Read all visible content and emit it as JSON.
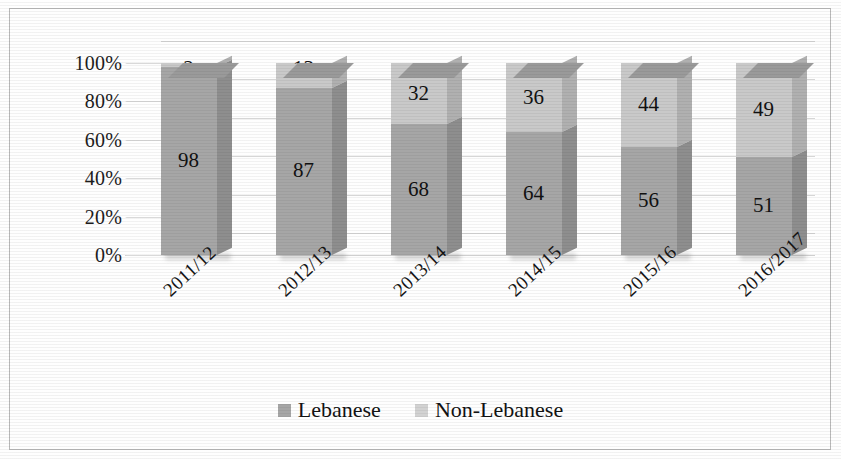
{
  "chart_data": {
    "type": "bar",
    "subtype": "stacked-100-percent-3d",
    "title": "",
    "xlabel": "",
    "ylabel": "",
    "ylim": [
      0,
      100
    ],
    "yticks": [
      "0%",
      "20%",
      "40%",
      "60%",
      "80%",
      "100%"
    ],
    "grid": true,
    "legend_position": "bottom-center",
    "categories": [
      "2011/12",
      "2012/13",
      "2013/14",
      "2014/15",
      "2015/16",
      "2016/2017"
    ],
    "series": [
      {
        "name": "Lebanese",
        "color": "#a6a6a6",
        "values": [
          98,
          87,
          68,
          64,
          56,
          51
        ]
      },
      {
        "name": "Non-Lebanese",
        "color": "#c9c9c9",
        "values": [
          2,
          13,
          32,
          36,
          44,
          49
        ]
      }
    ]
  },
  "axis": {
    "y_ticks": [
      {
        "label": "100%",
        "value": 100
      },
      {
        "label": "80%",
        "value": 80
      },
      {
        "label": "60%",
        "value": 60
      },
      {
        "label": "40%",
        "value": 40
      },
      {
        "label": "20%",
        "value": 20
      },
      {
        "label": "0%",
        "value": 0
      }
    ]
  },
  "legend": {
    "items": [
      {
        "label": "Lebanese",
        "color": "#a6a6a6"
      },
      {
        "label": "Non-Lebanese",
        "color": "#d2d2d2"
      }
    ]
  }
}
